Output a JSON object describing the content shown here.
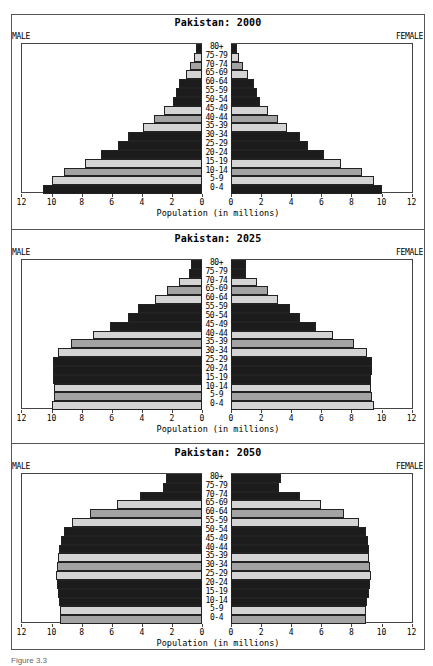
{
  "chart_data": [
    {
      "type": "bar",
      "subtype": "population-pyramid",
      "title": "Pakistan: 2000",
      "left_label": "MALE",
      "right_label": "FEMALE",
      "xlabel": "Population (in millions)",
      "xlim": [
        0,
        12
      ],
      "x_ticks": [
        12,
        10,
        8,
        6,
        4,
        2,
        0,
        0,
        2,
        4,
        6,
        8,
        10,
        12
      ],
      "categories": [
        "80+",
        "75-79",
        "70-74",
        "65-69",
        "60-64",
        "55-59",
        "50-54",
        "45-49",
        "40-44",
        "35-39",
        "30-34",
        "25-29",
        "20-24",
        "15-19",
        "10-14",
        "5-9",
        "0-4"
      ],
      "series": [
        {
          "name": "Male",
          "values": [
            0.4,
            0.55,
            0.8,
            1.05,
            1.5,
            1.7,
            1.9,
            2.5,
            3.2,
            3.95,
            4.9,
            5.6,
            6.7,
            7.8,
            9.2,
            10.0,
            10.55
          ]
        },
        {
          "name": "Female",
          "values": [
            0.4,
            0.55,
            0.8,
            1.15,
            1.5,
            1.75,
            1.95,
            2.45,
            3.15,
            3.7,
            4.6,
            5.1,
            6.2,
            7.3,
            8.7,
            9.5,
            10.05
          ]
        }
      ],
      "shades": [
        "black",
        "light",
        "medium",
        "light",
        "black",
        "black",
        "black",
        "light",
        "medium",
        "light",
        "black",
        "black",
        "black",
        "light",
        "medium",
        "light",
        "black"
      ],
      "grid": false
    },
    {
      "type": "bar",
      "subtype": "population-pyramid",
      "title": "Pakistan: 2025",
      "left_label": "MALE",
      "right_label": "FEMALE",
      "xlabel": "Population (in millions)",
      "xlim": [
        0,
        12
      ],
      "x_ticks": [
        12,
        10,
        8,
        6,
        4,
        2,
        0,
        0,
        2,
        4,
        6,
        8,
        10,
        12
      ],
      "categories": [
        "80+",
        "75-79",
        "70-74",
        "65-69",
        "60-64",
        "55-59",
        "50-54",
        "45-49",
        "40-44",
        "35-39",
        "30-34",
        "25-29",
        "20-24",
        "15-19",
        "10-14",
        "5-9",
        "0-4"
      ],
      "series": [
        {
          "name": "Male",
          "values": [
            0.75,
            0.85,
            1.5,
            2.35,
            3.15,
            4.25,
            4.95,
            6.1,
            7.25,
            8.7,
            9.55,
            9.9,
            9.9,
            9.9,
            9.85,
            9.85,
            9.95
          ]
        },
        {
          "name": "Female",
          "values": [
            1.0,
            1.0,
            1.7,
            2.45,
            3.1,
            3.95,
            4.6,
            5.65,
            6.75,
            8.15,
            9.05,
            9.35,
            9.4,
            9.3,
            9.3,
            9.35,
            9.5
          ]
        }
      ],
      "shades": [
        "black",
        "black",
        "light",
        "medium",
        "light",
        "black",
        "black",
        "black",
        "light",
        "medium",
        "light",
        "black",
        "black",
        "black",
        "light",
        "medium",
        "light"
      ],
      "grid": false
    },
    {
      "type": "bar",
      "subtype": "population-pyramid",
      "title": "Pakistan: 2050",
      "left_label": "MALE",
      "right_label": "FEMALE",
      "xlabel": "Population (in millions)",
      "xlim": [
        0,
        12
      ],
      "x_ticks": [
        12,
        10,
        8,
        6,
        4,
        2,
        0,
        0,
        2,
        4,
        6,
        8,
        10,
        12
      ],
      "categories": [
        "80+",
        "75-79",
        "70-74",
        "65-69",
        "60-64",
        "55-59",
        "50-54",
        "45-49",
        "40-44",
        "35-39",
        "30-34",
        "25-29",
        "20-24",
        "15-19",
        "10-14",
        "5-9",
        "0-4"
      ],
      "series": [
        {
          "name": "Male",
          "values": [
            2.4,
            2.6,
            4.1,
            5.65,
            7.45,
            8.65,
            9.2,
            9.4,
            9.5,
            9.6,
            9.65,
            9.72,
            9.65,
            9.6,
            9.5,
            9.45,
            9.45
          ]
        },
        {
          "name": "Female",
          "values": [
            3.35,
            3.2,
            4.6,
            5.95,
            7.5,
            8.5,
            8.95,
            9.1,
            9.15,
            9.2,
            9.25,
            9.3,
            9.25,
            9.2,
            9.05,
            9.0,
            9.0
          ]
        }
      ],
      "shades": [
        "black",
        "black",
        "black",
        "light",
        "medium",
        "light",
        "black",
        "black",
        "black",
        "light",
        "medium",
        "light",
        "black",
        "black",
        "black",
        "light",
        "medium"
      ],
      "grid": false
    }
  ],
  "colors": {
    "black": "#1c1c1c",
    "light": "#d4d4d4",
    "medium": "#a3a3a3",
    "frame": "#555555"
  },
  "panels": [
    {
      "title": "Pakistan: 2000",
      "male": "MALE",
      "female": "FEMALE",
      "xlabel": "Population (in millions)"
    },
    {
      "title": "Pakistan: 2025",
      "male": "MALE",
      "female": "FEMALE",
      "xlabel": "Population (in millions)"
    },
    {
      "title": "Pakistan: 2050",
      "male": "MALE",
      "female": "FEMALE",
      "xlabel": "Population (in millions)"
    }
  ],
  "caption": "Figure 3.3"
}
